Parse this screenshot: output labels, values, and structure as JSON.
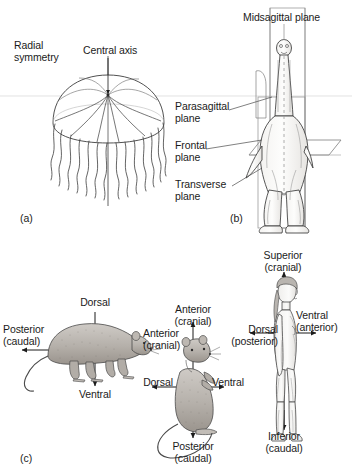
{
  "figure": {
    "background_color": "#ffffff",
    "ink_color": "#1b1b1b",
    "line_color": "#555555"
  },
  "panels": [
    {
      "id": "panel-a",
      "label": "(a)",
      "x": 20,
      "y": 212,
      "subject": "radially symmetrical jellyfish"
    },
    {
      "id": "panel-b",
      "label": "(b)",
      "x": 230,
      "y": 212,
      "subject": "bilaterally symmetrical dinosaur with section planes"
    },
    {
      "id": "panel-c",
      "label": "(c)",
      "x": 20,
      "y": 452,
      "subject": "directional terms on rats and human"
    }
  ],
  "panel_a": {
    "labels": [
      {
        "name": "radial-symmetry-label",
        "text": "Radial\nsymmetry",
        "x": 14,
        "y": 40,
        "align": "left"
      },
      {
        "name": "central-axis-label",
        "text": "Central axis",
        "x": 83,
        "y": 45,
        "align": "left"
      }
    ]
  },
  "panel_b": {
    "labels": [
      {
        "name": "midsagittal-plane-label",
        "text": "Midsagittal plane",
        "x": 243,
        "y": 12,
        "align": "left"
      },
      {
        "name": "parasagittal-plane-label",
        "text": "Parasagittal\nplane",
        "x": 175,
        "y": 101,
        "align": "left"
      },
      {
        "name": "frontal-plane-label",
        "text": "Frontal\nplane",
        "x": 175,
        "y": 140,
        "align": "left"
      },
      {
        "name": "transverse-plane-label",
        "text": "Transverse\nplane",
        "x": 175,
        "y": 179,
        "align": "left"
      }
    ]
  },
  "panel_c": {
    "rat_lateral": {
      "name": "rat-on-all-fours",
      "labels": [
        {
          "name": "dorsal-label",
          "text": "Dorsal",
          "x": 95,
          "y": 297,
          "align": "center"
        },
        {
          "name": "posterior-caudal-label",
          "text": "Posterior\n(caudal)",
          "x": 3,
          "y": 324,
          "align": "left"
        },
        {
          "name": "anterior-cranial-label",
          "text": "Anterior\n(cranial)",
          "x": 143,
          "y": 328,
          "align": "left"
        },
        {
          "name": "ventral-label",
          "text": "Ventral",
          "x": 95,
          "y": 389,
          "align": "center"
        }
      ]
    },
    "rat_upright": {
      "name": "rat-sitting-upright",
      "labels": [
        {
          "name": "anterior-cranial-label",
          "text": "Anterior\n(cranial)",
          "x": 193,
          "y": 304,
          "align": "center"
        },
        {
          "name": "dorsal-label",
          "text": "Dorsal",
          "x": 158,
          "y": 377,
          "align": "center"
        },
        {
          "name": "ventral-label",
          "text": "Ventral",
          "x": 228,
          "y": 377,
          "align": "center"
        },
        {
          "name": "posterior-caudal-label",
          "text": "Posterior\n(caudal)",
          "x": 193,
          "y": 441,
          "align": "center"
        }
      ]
    },
    "human": {
      "name": "standing-human-figure",
      "labels": [
        {
          "name": "superior-cranial-label",
          "text": "Superior\n(cranial)",
          "x": 283,
          "y": 250,
          "align": "center"
        },
        {
          "name": "ventral-anterior-label",
          "text": "Ventral\n(anterior)",
          "x": 296,
          "y": 310,
          "align": "left"
        },
        {
          "name": "dorsal-posterior-label",
          "text": "Dorsal\n(posterior)",
          "x": 278,
          "y": 324,
          "align": "right"
        },
        {
          "name": "inferior-caudal-label",
          "text": "Inferior\n(caudal)",
          "x": 284,
          "y": 431,
          "align": "center"
        }
      ]
    }
  }
}
